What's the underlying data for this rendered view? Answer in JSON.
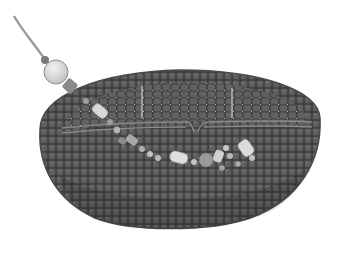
{
  "image": {
    "description": "Grayscale 3D rendering of a bead-like lattice basket (bowl shape) built of small cubes, with a chain of lighter beads and capsules threading diagonally from an upper-left tether through the basket interior",
    "colors": {
      "background": "#ffffff",
      "bead_dark": "#5a5a5a",
      "bead_edge": "#3c3c3c",
      "bead_light": "#d8d8d8",
      "bead_mid": "#8e8e8e",
      "tether": "#9a9a9a",
      "rim_band": "#7a7a7a"
    },
    "elements": {
      "tether": "thin line from top-left corner to large sphere",
      "large_sphere": "light gray sphere near upper-left rim",
      "basket": "dark gray cube lattice, elliptical bowl",
      "rim_band": "horizontal double-line band across basket interior",
      "bead_chain": "light beads and capsules descending from left to center-right"
    }
  }
}
